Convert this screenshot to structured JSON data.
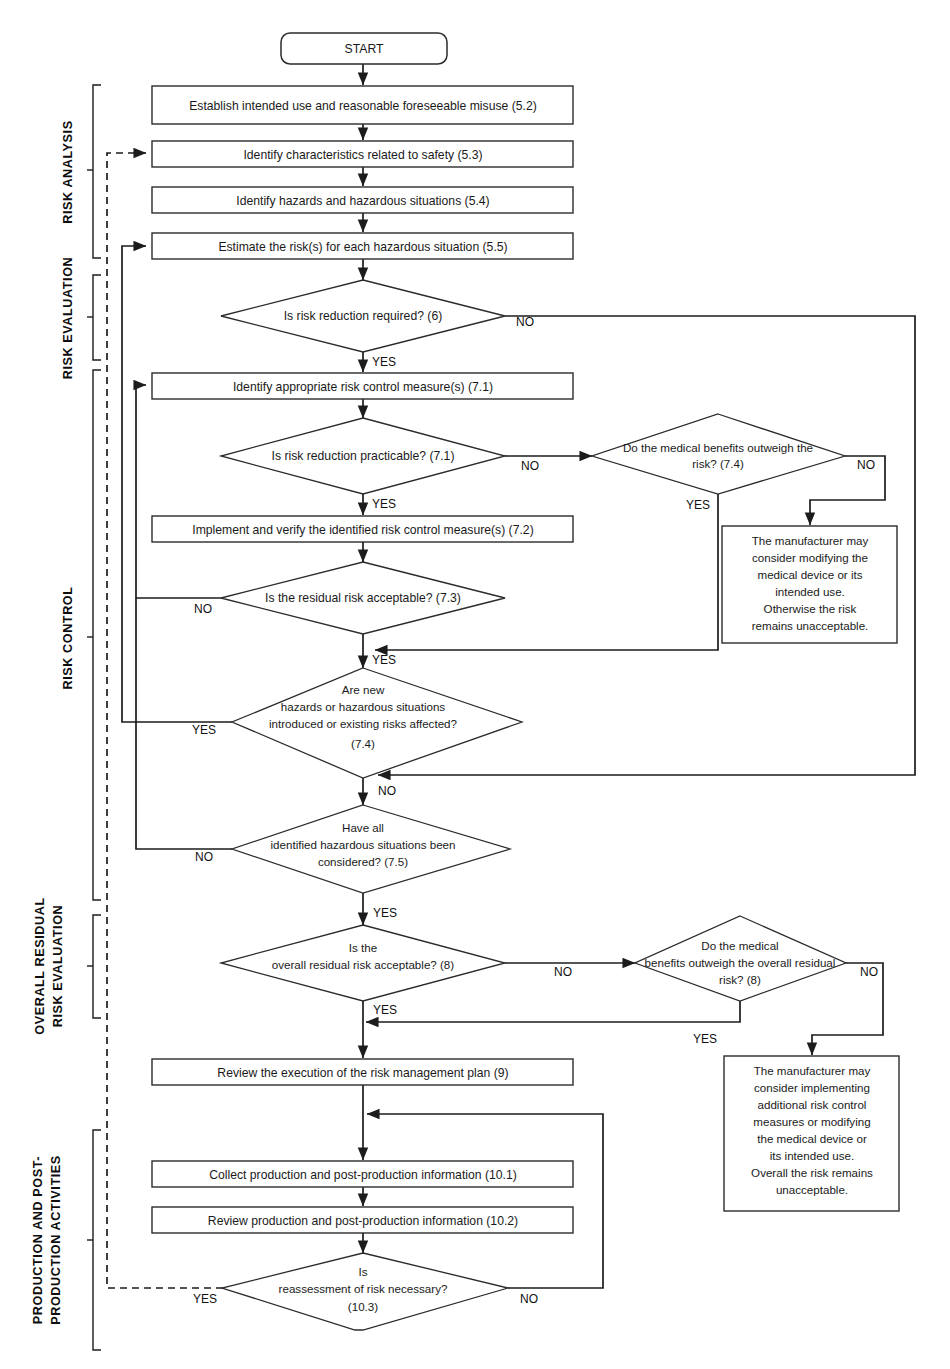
{
  "diagram": {
    "type": "flowchart"
  },
  "phases": [
    {
      "id": "risk-analysis",
      "label": "RISK ANALYSIS"
    },
    {
      "id": "risk-evaluation",
      "label": "RISK EVALUATION"
    },
    {
      "id": "risk-control",
      "label": "RISK CONTROL"
    },
    {
      "id": "overall-residual",
      "label": "OVERALL RESIDUAL\nRISK EVALUATION"
    },
    {
      "id": "overall-residual-line1",
      "label": "OVERALL RESIDUAL"
    },
    {
      "id": "overall-residual-line2",
      "label": "RISK EVALUATION"
    },
    {
      "id": "production-line1",
      "label": "PRODUCTION AND POST-"
    },
    {
      "id": "production-line2",
      "label": "PRODUCTION ACTIVITIES"
    }
  ],
  "nodes": {
    "start": {
      "label": "START",
      "shape": "terminator"
    },
    "establish_use": {
      "label": "Establish intended use and reasonable foreseeable misuse (5.2)",
      "shape": "process"
    },
    "identify_chars": {
      "label": "Identify characteristics related to safety (5.3)",
      "shape": "process"
    },
    "identify_hazards": {
      "label": "Identify hazards and hazardous situations (5.4)",
      "shape": "process"
    },
    "estimate_risk": {
      "label": "Estimate the risk(s) for each hazardous situation (5.5)",
      "shape": "process"
    },
    "risk_reduction_required": {
      "label": "Is risk reduction required? (6)",
      "shape": "decision"
    },
    "identify_control": {
      "label": "Identify appropriate risk control measure(s) (7.1)",
      "shape": "process"
    },
    "reduction_practicable": {
      "label": "Is risk reduction practicable? (7.1)",
      "shape": "decision"
    },
    "benefits_outweigh_74": {
      "line1": "Do the medical benefits outweigh the",
      "line2": "risk? (7.4)",
      "shape": "decision"
    },
    "implement_verify": {
      "label": "Implement and verify the identified risk control measure(s) (7.2)",
      "shape": "process"
    },
    "residual_acceptable": {
      "label": "Is the residual risk acceptable? (7.3)",
      "shape": "decision"
    },
    "new_hazards": {
      "line1": "Are new",
      "line2": "hazards or hazardous situations",
      "line3": "introduced or existing risks affected?",
      "line4": "(7.4)",
      "shape": "decision"
    },
    "all_considered": {
      "line1": "Have all",
      "line2": "identified hazardous situations been",
      "line3": "considered? (7.5)",
      "shape": "decision"
    },
    "overall_acceptable": {
      "line1": "Is the",
      "line2": "overall residual risk acceptable? (8)",
      "shape": "decision"
    },
    "benefits_outweigh_8": {
      "line1": "Do the medical",
      "line2": "benefits outweigh the overall residual",
      "line3": "risk? (8)",
      "shape": "decision"
    },
    "review_plan": {
      "label": "Review the execution of the risk management plan (9)",
      "shape": "process"
    },
    "collect_info": {
      "label": "Collect production and post-production information (10.1)",
      "shape": "process"
    },
    "review_info": {
      "label": "Review production and post-production information (10.2)",
      "shape": "process"
    },
    "reassessment": {
      "line1": "Is",
      "line2": "reassessment of risk necessary?",
      "line3": "(10.3)",
      "shape": "decision"
    },
    "note_unacceptable_74": {
      "shape": "note",
      "line1": "The manufacturer may",
      "line2": "consider modifying the",
      "line3": "medical device or its",
      "line4": "intended use.",
      "line5": "Otherwise the risk",
      "line6": "remains unacceptable."
    },
    "note_unacceptable_8": {
      "shape": "note",
      "line1": "The manufacturer may",
      "line2": "consider implementing",
      "line3": "additional risk control",
      "line4": "measures or modifying",
      "line5": "the medical device or",
      "line6": "its intended use.",
      "line7": "Overall the risk remains",
      "line8": "unacceptable."
    }
  },
  "edge_labels": {
    "no": "NO",
    "yes": "YES",
    "rr_no": "NO",
    "rr_yes": "YES",
    "prac_no": "NO",
    "prac_yes": "YES",
    "ben74_no": "NO",
    "ben74_yes": "YES",
    "resid_no": "NO",
    "resid_yes": "YES",
    "newhaz_yes": "YES",
    "newhaz_no": "NO",
    "allcons_no": "NO",
    "allcons_yes": "YES",
    "overall_no": "NO",
    "overall_yes": "YES",
    "ben8_no": "NO",
    "ben8_yes": "YES",
    "reassess_yes": "YES",
    "reassess_no": "NO"
  },
  "colors": {
    "stroke": "#2b2b2b",
    "connector": "#1c1c1c",
    "background": "#ffffff",
    "text": "#1a1a1a"
  }
}
